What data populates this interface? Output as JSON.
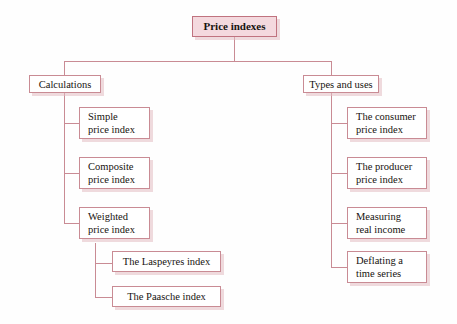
{
  "diagram": {
    "title": "Price indexes",
    "type": "tree",
    "root": {
      "label": "Price indexes"
    },
    "branches": [
      {
        "label": "Calculations",
        "children": [
          {
            "line1": "Simple",
            "line2": "price index"
          },
          {
            "line1": "Composite",
            "line2": "price index"
          },
          {
            "line1": "Weighted",
            "line2": "price index"
          }
        ],
        "subchildren": [
          {
            "label": "The Laspeyres index"
          },
          {
            "label": "The Paasche index"
          }
        ]
      },
      {
        "label": "Types and uses",
        "children": [
          {
            "line1": "The consumer",
            "line2": "price index"
          },
          {
            "line1": "The producer",
            "line2": "price index"
          },
          {
            "line1": "Measuring",
            "line2": "real income"
          },
          {
            "line1": "Deflating a",
            "line2": "time series"
          }
        ]
      }
    ]
  },
  "colors": {
    "border": "#c98b94",
    "root_fill": "#f4d9de",
    "root_border": "#c0737f",
    "shadow": "#e2bcc1",
    "text": "#17130f",
    "background": "#fefefe"
  }
}
